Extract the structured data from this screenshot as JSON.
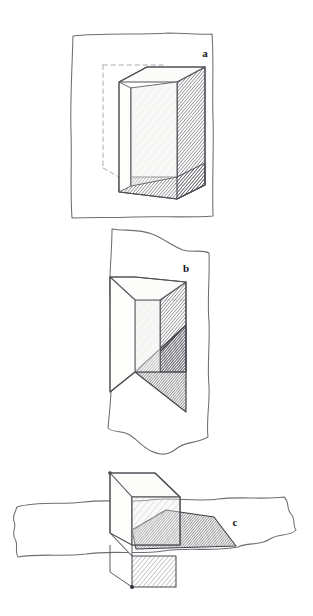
{
  "figure": {
    "medium": "pencil-sketch",
    "background_color": "#ffffff",
    "ink_color": "#3a3a3e",
    "panel_count": 3,
    "canvas": {
      "width": 313,
      "height": 616
    }
  },
  "panels": [
    {
      "id": "a",
      "label": "a",
      "label_position": {
        "x": 205,
        "y": 57
      },
      "caption_visible": false,
      "description": "Cube resting in front of a rectangular sheet; hidden rear edges dashed; right side face and bottom face hatched.",
      "plane": {
        "shape": "rectangle",
        "style": "hand-drawn-wobbly",
        "bounds": {
          "x": 71,
          "y": 33,
          "width": 143,
          "height": 185
        }
      },
      "solid": {
        "type": "cube",
        "visible_faces": [
          "front",
          "top",
          "right"
        ],
        "shaded_faces": [
          "front",
          "right",
          "bottom"
        ],
        "hidden_edges": "dashed",
        "hatch_faces": [
          "right",
          "bottom"
        ]
      }
    },
    {
      "id": "b",
      "label": "b",
      "label_position": {
        "x": 186,
        "y": 272
      },
      "caption_visible": false,
      "description": "Cube piercing a vertical torn sheet; the portion of the cube behind the sheet is darkly hatched, forming a triangular wedge below.",
      "plane": {
        "shape": "irregular-torn-sheet",
        "orientation": "vertical",
        "style": "hand-drawn-wobbly",
        "bounds": {
          "x": 108,
          "y": 228,
          "width": 104,
          "height": 228
        }
      },
      "solid": {
        "type": "cube",
        "visible_faces": [
          "front",
          "top",
          "right"
        ],
        "shaded_faces": [
          "front",
          "right"
        ],
        "hatch_faces": [
          "right",
          "intersection-wedge"
        ]
      }
    },
    {
      "id": "c",
      "label": "c",
      "label_position": {
        "x": 235,
        "y": 526
      },
      "caption_visible": false,
      "description": "Cube passing through a horizontal torn sheet; the front face is hatched, a dark hatched shadow spreads right across the sheet, and the lower part of the cube shows beneath the sheet.",
      "plane": {
        "shape": "irregular-torn-sheet",
        "orientation": "horizontal",
        "style": "hand-drawn-wobbly",
        "bounds": {
          "x": 14,
          "y": 495,
          "width": 283,
          "height": 78
        }
      },
      "solid": {
        "type": "cube",
        "visible_faces": [
          "front",
          "top",
          "left"
        ],
        "shaded_faces": [
          "front",
          "below-plane-section"
        ],
        "hatch_faces": [
          "front",
          "shadow",
          "below-plane-section"
        ],
        "vertex_markers": 2
      }
    }
  ],
  "colors": {
    "ink": "#3a3a3e",
    "ink_light": "#9a9aa0",
    "hatch_light": "#b7b7bd",
    "hatch_dark": "#4a4a50",
    "face_tint": "#f2f2f0",
    "paper": "#ffffff"
  }
}
